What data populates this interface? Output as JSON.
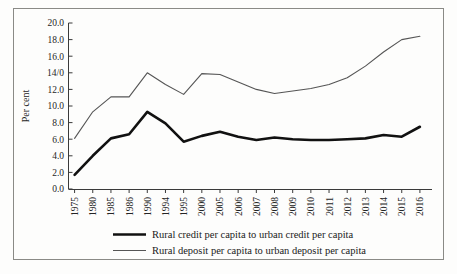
{
  "figure": {
    "y_axis_title": "Per cent",
    "border_color": "#8a8a86",
    "background_color": "#fdfdfc"
  },
  "legend": {
    "position": "bottom",
    "items": [
      {
        "label": "Rural credit per capita to urban credit per capita",
        "style": "thick-black",
        "color": "#111111"
      },
      {
        "label": "Rural deposit per capita to urban deposit per capita",
        "style": "thin-grey",
        "color": "#555555"
      }
    ]
  },
  "chart_data": {
    "type": "line",
    "title": "",
    "subtitle": "",
    "xlabel": "",
    "ylabel": "Per cent",
    "ylim": [
      0.0,
      20.0
    ],
    "ytick_step": 2.0,
    "ytick_labels": [
      "0.0",
      "2.0",
      "4.0",
      "6.0",
      "8.0",
      "10.0",
      "12.0",
      "14/0",
      "16.0",
      "18.0",
      "20.0"
    ],
    "ytick_values": [
      0.0,
      2.0,
      4.0,
      6.0,
      8.0,
      10.0,
      12.0,
      14.0,
      16.0,
      18.0,
      20.0
    ],
    "grid": false,
    "legend_position": "bottom",
    "categories": [
      "1975",
      "1980",
      "1985",
      "1986",
      "1990",
      "1994",
      "1995",
      "2000",
      "2005",
      "2006",
      "2007",
      "2008",
      "2009",
      "2010",
      "2011",
      "2012",
      "2013",
      "2014",
      "2015",
      "2016"
    ],
    "series": [
      {
        "name": "Rural credit per capita to urban credit per capita",
        "color": "#111111",
        "values": [
          1.7,
          4.0,
          6.1,
          6.6,
          9.3,
          7.9,
          5.7,
          6.4,
          6.9,
          6.3,
          5.9,
          6.2,
          6.0,
          5.9,
          5.9,
          6.0,
          6.1,
          6.5,
          6.3,
          7.5
        ]
      },
      {
        "name": "Rural deposit per capita to urban deposit per capita",
        "color": "#555555",
        "values": [
          6.1,
          9.3,
          11.1,
          11.1,
          14.0,
          12.6,
          11.4,
          13.9,
          13.8,
          12.9,
          12.0,
          11.5,
          11.8,
          12.1,
          12.6,
          13.4,
          14.8,
          16.5,
          18.0,
          18.4
        ]
      }
    ]
  }
}
